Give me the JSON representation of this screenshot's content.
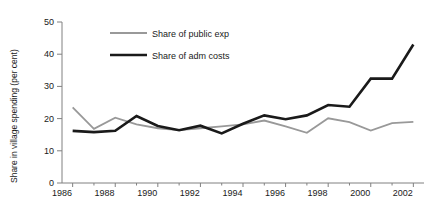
{
  "chart_data": {
    "type": "line",
    "title": "",
    "xlabel": "",
    "ylabel": "Share in village spending (per cent)",
    "x": [
      1986,
      1987,
      1988,
      1989,
      1990,
      1991,
      1992,
      1993,
      1994,
      1995,
      1996,
      1997,
      1998,
      1999,
      2000,
      2001,
      2002
    ],
    "xlim": [
      1985.5,
      2002.5
    ],
    "ylim": [
      0,
      50
    ],
    "ytick_labels": [
      "0",
      "10",
      "20",
      "30",
      "40",
      "50"
    ],
    "ytick_values": [
      0,
      10,
      20,
      30,
      40,
      50
    ],
    "xtick_labels": [
      "1986",
      "1988",
      "1990",
      "1992",
      "1994",
      "1996",
      "1998",
      "2000",
      "2002"
    ],
    "xtick_values": [
      1986,
      1988,
      1990,
      1992,
      1994,
      1996,
      1998,
      2000,
      2002
    ],
    "xminor_values": [
      1987,
      1989,
      1991,
      1993,
      1995,
      1997,
      1999,
      2001
    ],
    "grid": false,
    "legend_position": "upper-left-inside",
    "series": [
      {
        "name": "Share of public exp",
        "color": "#999999",
        "width": 1.8,
        "values": [
          23.5,
          16.8,
          20.3,
          18.2,
          17.0,
          16.4,
          17.0,
          17.6,
          18.2,
          19.4,
          17.6,
          15.6,
          20.1,
          18.9,
          16.3,
          18.6,
          19.0
        ]
      },
      {
        "name": "Share of adm costs",
        "color": "#1a1a1a",
        "width": 2.6,
        "values": [
          16.2,
          15.8,
          16.2,
          20.8,
          17.7,
          16.4,
          17.8,
          15.4,
          18.4,
          21.0,
          19.8,
          21.0,
          24.2,
          23.7,
          32.4,
          32.4,
          43.0
        ]
      }
    ]
  },
  "legend": {
    "items": [
      {
        "label": "Share of public exp"
      },
      {
        "label": "Share of adm costs"
      }
    ]
  },
  "axes": {
    "y_axis_title": "Share in village spending (per cent)"
  }
}
